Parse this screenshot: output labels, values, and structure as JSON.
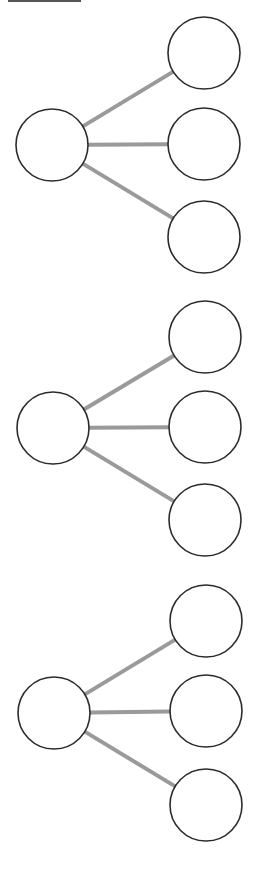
{
  "diagram": {
    "title": "",
    "colors": {
      "background": "#ffffff",
      "node_stroke": "#2b2b2b",
      "node_fill": "#ffffff",
      "edge": "#9a9a9a"
    },
    "node_radius": 36,
    "groups": [
      {
        "id": "tree-1",
        "root": {
          "cx": 52,
          "cy": 145
        },
        "children": [
          {
            "cx": 204,
            "cy": 53
          },
          {
            "cx": 204,
            "cy": 144
          },
          {
            "cx": 204,
            "cy": 237
          }
        ]
      },
      {
        "id": "tree-2",
        "root": {
          "cx": 53,
          "cy": 428
        },
        "children": [
          {
            "cx": 205,
            "cy": 337
          },
          {
            "cx": 205,
            "cy": 427
          },
          {
            "cx": 205,
            "cy": 520
          }
        ]
      },
      {
        "id": "tree-3",
        "root": {
          "cx": 54,
          "cy": 713
        },
        "children": [
          {
            "cx": 206,
            "cy": 621
          },
          {
            "cx": 206,
            "cy": 711
          },
          {
            "cx": 206,
            "cy": 805
          }
        ]
      }
    ]
  }
}
